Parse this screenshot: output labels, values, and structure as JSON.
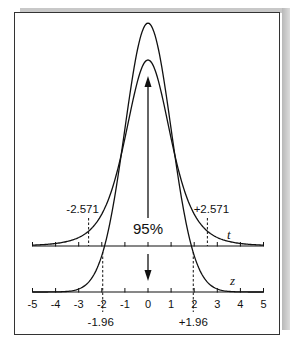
{
  "chart_data": {
    "type": "line",
    "title": "",
    "x_ticks": [
      -5,
      -4,
      -3,
      -2,
      -1,
      0,
      1,
      2,
      3,
      4,
      5
    ],
    "xlim": [
      -5,
      5
    ],
    "series": [
      {
        "name": "t",
        "distribution": "student_t",
        "df": 5,
        "axis_label": "t",
        "critical_values": [
          -2.571,
          2.571
        ],
        "critical_labels": [
          "-2.571",
          "+2.571"
        ]
      },
      {
        "name": "z",
        "distribution": "normal",
        "mean": 0,
        "sd": 1,
        "axis_label": "z",
        "critical_values": [
          -1.96,
          1.96
        ],
        "critical_labels": [
          "-1.96",
          "+1.96"
        ]
      }
    ],
    "annotations": [
      {
        "text": "95%",
        "x": 0
      }
    ],
    "grid": false,
    "legend": "none"
  },
  "colors": {
    "line": "#111111",
    "frame": "#333333",
    "shadow": "#c0c0c0"
  }
}
